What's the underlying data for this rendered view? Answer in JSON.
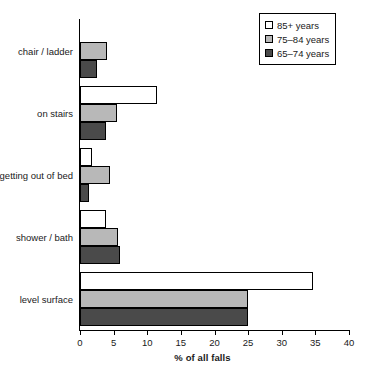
{
  "chart_data": {
    "type": "bar",
    "orientation": "horizontal",
    "title": "",
    "xlabel": "% of all falls",
    "ylabel": "",
    "xlim": [
      0,
      40
    ],
    "xticks": [
      0,
      5,
      10,
      15,
      20,
      25,
      30,
      35,
      40
    ],
    "grid": false,
    "legend_position": "top-right",
    "categories": [
      "chair / ladder",
      "on stairs",
      "getting out of bed",
      "shower / bath",
      "level surface"
    ],
    "series": [
      {
        "name": "85+ years",
        "color": "#ffffff",
        "values": [
          0,
          11.5,
          1.8,
          3.8,
          34.7
        ]
      },
      {
        "name": "75–84 years",
        "color": "#b8b8b8",
        "values": [
          4.0,
          5.5,
          4.5,
          5.7,
          25.0
        ]
      },
      {
        "name": "65–74 years",
        "color": "#4a4a4a",
        "values": [
          2.6,
          3.9,
          1.3,
          5.9,
          25.0
        ]
      }
    ]
  },
  "axis": {
    "x_title": "% of all falls",
    "tick_labels": [
      "0",
      "5",
      "10",
      "15",
      "20",
      "25",
      "30",
      "35",
      "40"
    ]
  },
  "legend": {
    "entries": [
      {
        "label": "85+ years"
      },
      {
        "label": "75–84 years"
      },
      {
        "label": "65–74 years"
      }
    ]
  }
}
